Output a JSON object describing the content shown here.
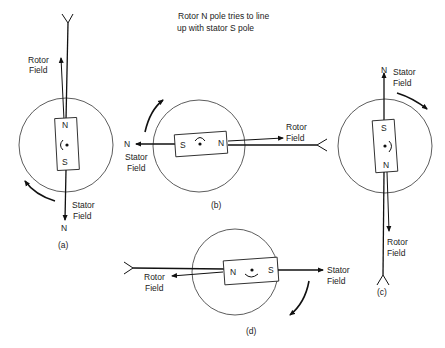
{
  "title": {
    "line1": "Rotor N pole tries to line",
    "line2": "up with stator S pole"
  },
  "panels": [
    {
      "id": "a",
      "caption": "(a)",
      "rotor_poles": {
        "top": "N",
        "bottom": "S"
      },
      "rotor_field": {
        "line1": "Rotor",
        "line2": "Field"
      },
      "stator_field": {
        "line1": "Stator",
        "line2": "Field"
      },
      "stator_pole": "N",
      "rotation": "counterclockwise"
    },
    {
      "id": "b",
      "caption": "(b)",
      "rotor_poles": {
        "left": "S",
        "right": "N"
      },
      "rotor_field": {
        "line1": "Rotor",
        "line2": "Field"
      },
      "stator_field": {
        "line1": "Stator",
        "line2": "Field"
      },
      "stator_pole": "N",
      "rotation": "clockwise"
    },
    {
      "id": "c",
      "caption": "(c)",
      "rotor_poles": {
        "top": "S",
        "bottom": "N"
      },
      "rotor_field": {
        "line1": "Rotor",
        "line2": "Field"
      },
      "stator_field": {
        "line1": "Stator",
        "line2": "Field"
      },
      "stator_pole": "N",
      "rotation": "clockwise"
    },
    {
      "id": "d",
      "caption": "(d)",
      "rotor_poles": {
        "left": "N",
        "right": "S"
      },
      "rotor_field": {
        "line1": "Rotor",
        "line2": "Field"
      },
      "stator_field": {
        "line1": "Stator",
        "line2": "Field"
      },
      "rotation": "clockwise"
    }
  ]
}
